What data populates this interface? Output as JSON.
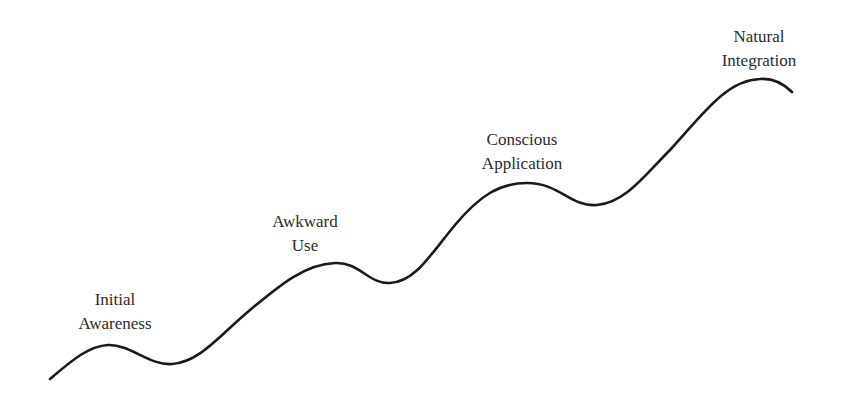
{
  "diagram": {
    "type": "learning-curve",
    "curve_color": "#1a1a1a",
    "text_color": "#2b2b2b",
    "background": "#ffffff",
    "stages": [
      {
        "line1": "Initial",
        "line2": "Awareness",
        "label_x": 115,
        "label_y": 288,
        "peak": [
          108,
          345
        ]
      },
      {
        "line1": "Awkward",
        "line2": "Use",
        "label_x": 305,
        "label_y": 210,
        "peak": [
          335,
          263
        ]
      },
      {
        "line1": "Conscious",
        "line2": "Application",
        "label_x": 522,
        "label_y": 128,
        "peak": [
          527,
          183
        ]
      },
      {
        "line1": "Natural",
        "line2": "Integration",
        "label_x": 759,
        "label_y": 25,
        "peak": [
          760,
          79
        ]
      }
    ]
  }
}
